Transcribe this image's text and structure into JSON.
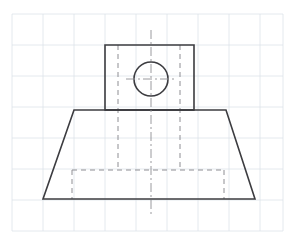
{
  "canvas": {
    "width": 295,
    "height": 243,
    "background_color": "#ffffff",
    "title": "Orthographic front view of a trapezoidal base with cylindrical boss and through hole"
  },
  "grid": {
    "visible": true,
    "label": "graph-paper-grid",
    "color": "#dde3ea",
    "line_width": 0.8,
    "spacing": 31,
    "origin_x": 12,
    "origin_y": 14,
    "vertical_lines_x": [
      12,
      43,
      74,
      105,
      136,
      167,
      198,
      229,
      260,
      283
    ],
    "horizontal_lines_y": [
      14,
      45,
      76,
      107,
      138,
      169,
      200,
      231
    ]
  },
  "styles": {
    "visible_edge_color": "#3c3c40",
    "visible_edge_width": 1.6,
    "hidden_edge_color": "#8e8e93",
    "hidden_edge_width": 1.0,
    "hidden_dash": "5 4",
    "center_line_color": "#8e8e93",
    "center_line_width": 0.9,
    "center_dash": "9 3 2 3"
  },
  "geometry": {
    "boss": {
      "label": "Boss rectangle (upright block)",
      "left": 105,
      "right": 194,
      "top": 45,
      "bottom": 110,
      "width": 89,
      "height": 65,
      "points": "105,45 194,45 194,110 105,110"
    },
    "hole": {
      "label": "Through hole circle",
      "center_x": 151,
      "center_y": 79,
      "radius": 17,
      "diameter": 34
    },
    "base": {
      "label": "Trapezoidal base",
      "top_left_x": 74,
      "top_right_x": 226,
      "top_y": 110,
      "bottom_left_x": 43,
      "bottom_right_x": 255,
      "bottom_y": 199,
      "top_width": 152,
      "bottom_width": 212,
      "height": 89,
      "points": "74,110 226,110 255,199 43,199"
    }
  },
  "hidden_lines": [
    {
      "name": "hidden-vertical-left",
      "label": "Left hidden edge of inner slot",
      "x1": 118,
      "y1": 45,
      "x2": 118,
      "y2": 171
    },
    {
      "name": "hidden-vertical-right",
      "label": "Right hidden edge of inner slot",
      "x1": 180,
      "y1": 45,
      "x2": 180,
      "y2": 171
    },
    {
      "name": "hidden-recess-top",
      "label": "Top edge of hidden bottom recess",
      "x1": 72,
      "y1": 170,
      "x2": 224,
      "y2": 170
    },
    {
      "name": "hidden-recess-left",
      "label": "Left edge of hidden bottom recess",
      "x1": 72,
      "y1": 170,
      "x2": 72,
      "y2": 199
    },
    {
      "name": "hidden-recess-right",
      "label": "Right edge of hidden bottom recess",
      "x1": 224,
      "y1": 170,
      "x2": 224,
      "y2": 199
    }
  ],
  "center_lines": [
    {
      "name": "center-line-vertical",
      "label": "Vertical axis centerline",
      "x1": 151,
      "y1": 30,
      "x2": 151,
      "y2": 215
    },
    {
      "name": "center-line-horizontal",
      "label": "Horizontal centerline of hole",
      "x1": 126,
      "y1": 79,
      "x2": 176,
      "y2": 79
    }
  ]
}
